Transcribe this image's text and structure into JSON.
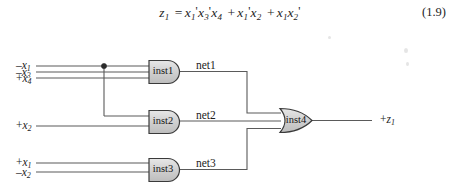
{
  "equation": {
    "lhs": "z",
    "lhs_sub": "1",
    "text_plain": "z1 = x1'x3'x4 + x1'x2 + x1x2'",
    "number": "(1.9)",
    "terms": [
      {
        "vars": [
          {
            "name": "x",
            "sub": "1",
            "prime": true
          },
          {
            "name": "x",
            "sub": "3",
            "prime": true
          },
          {
            "name": "x",
            "sub": "4",
            "prime": false
          }
        ]
      },
      {
        "vars": [
          {
            "name": "x",
            "sub": "1",
            "prime": true
          },
          {
            "name": "x",
            "sub": "2",
            "prime": false
          }
        ]
      },
      {
        "vars": [
          {
            "name": "x",
            "sub": "1",
            "prime": false
          },
          {
            "name": "x",
            "sub": "2",
            "prime": true
          }
        ]
      }
    ]
  },
  "circuit": {
    "inputs": [
      {
        "id": "in-x1-neg",
        "sign": "–",
        "var": "x",
        "sub": "1",
        "y": 66
      },
      {
        "id": "in-x3-neg",
        "sign": "–",
        "var": "x",
        "sub": "3",
        "y": 72
      },
      {
        "id": "in-x4-pos",
        "sign": "+",
        "var": "x",
        "sub": "4",
        "y": 78
      },
      {
        "id": "in-x2-pos",
        "sign": "+",
        "var": "x",
        "sub": "2",
        "y": 126
      },
      {
        "id": "in-x1-pos",
        "sign": "+",
        "var": "x",
        "sub": "1",
        "y": 163
      },
      {
        "id": "in-x2-neg",
        "sign": "–",
        "var": "x",
        "sub": "2",
        "y": 172
      }
    ],
    "gates": [
      {
        "id": "inst1",
        "label": "inst1",
        "type": "and",
        "x": 148,
        "y": 60,
        "w": 32,
        "h": 23
      },
      {
        "id": "inst2",
        "label": "inst2",
        "type": "and",
        "x": 148,
        "y": 110,
        "w": 32,
        "h": 23
      },
      {
        "id": "inst3",
        "label": "inst3",
        "type": "and",
        "x": 148,
        "y": 158,
        "w": 32,
        "h": 23
      },
      {
        "id": "inst4",
        "label": "inst4",
        "type": "or",
        "x": 280,
        "y": 108,
        "w": 32,
        "h": 25
      }
    ],
    "nets": [
      {
        "id": "net1",
        "label": "net1",
        "x": 196,
        "y": 62
      },
      {
        "id": "net2",
        "label": "net2",
        "x": 196,
        "y": 112
      },
      {
        "id": "net3",
        "label": "net3",
        "x": 196,
        "y": 160
      }
    ],
    "output": {
      "id": "out-z1",
      "sign": "+",
      "var": "z",
      "sub": "1",
      "x": 380,
      "y": 114
    },
    "junction": {
      "x": 104,
      "y": 66
    },
    "colors": {
      "wire": "#5a5a5a",
      "gate_fill": "#d4d4d4",
      "gate_stroke": "#3a3a3a",
      "text": "#1d1d1d",
      "background": "#ffffff"
    }
  }
}
